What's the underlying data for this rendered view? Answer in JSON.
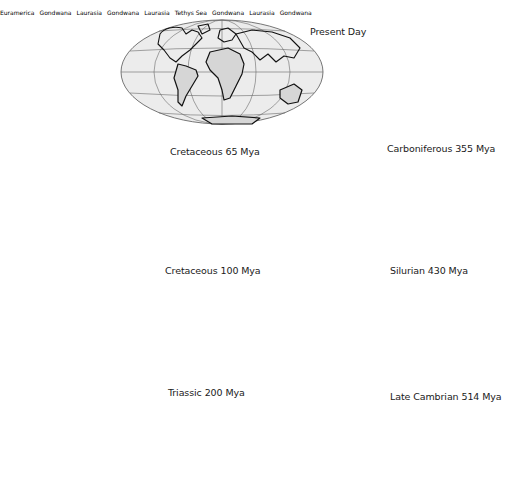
{
  "figure": {
    "maps": [
      {
        "id": "present-day",
        "label": "Present Day",
        "regions": []
      },
      {
        "id": "cretaceous-65",
        "label": "Cretaceous 65 Mya",
        "regions": []
      },
      {
        "id": "carboniferous-355",
        "label": "Carboniferous 355 Mya",
        "regions": [
          "Euramerica",
          "Gondwana"
        ]
      },
      {
        "id": "cretaceous-100",
        "label": "Cretaceous 100 Mya",
        "regions": []
      },
      {
        "id": "silurian-430",
        "label": "Silurian 430 Mya",
        "regions": [
          "Laurasia",
          "Gondwana"
        ]
      },
      {
        "id": "triassic-200",
        "label": "Triassic 200 Mya",
        "regions": [
          "Laurasia",
          "Tethys Sea",
          "Gondwana"
        ]
      },
      {
        "id": "late-cambrian-514",
        "label": "Late Cambrian 514 Mya",
        "regions": [
          "Laurasia",
          "Gondwana"
        ]
      }
    ]
  },
  "colors": {
    "ocean": "#ececec",
    "land": "#d6d6d6",
    "outline": "#111111",
    "grid": "#6a6a6a"
  }
}
